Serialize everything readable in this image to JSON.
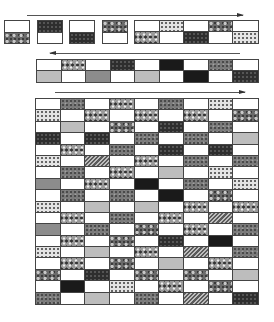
{
  "diagram": {
    "arrows": [
      {
        "id": "row1-direction",
        "direction": "right",
        "x": 27,
        "y": 15,
        "length": 216
      },
      {
        "id": "row2-direction",
        "direction": "left",
        "x": 50,
        "y": 53,
        "length": 190
      },
      {
        "id": "assembled-direction",
        "direction": "right",
        "x": 55,
        "y": 92,
        "length": 190
      }
    ],
    "loose_units": [
      {
        "top": "w",
        "bottom": "paisley"
      },
      {
        "top": "dark",
        "bottom": "w"
      },
      {
        "top": "w",
        "bottom": "dark"
      },
      {
        "top": "paisley",
        "bottom": "w"
      }
    ],
    "strip_row1": {
      "top": [
        "w",
        "dots",
        "w",
        "paisley",
        "w"
      ],
      "bottom": [
        "floral",
        "w",
        "dark",
        "w",
        "dots"
      ]
    },
    "strip_row2": {
      "top": [
        "w",
        "floral",
        "w",
        "dark",
        "w",
        "black",
        "w",
        "print",
        "w"
      ],
      "bottom": [
        "light",
        "w",
        "mid",
        "w",
        "light",
        "w",
        "black",
        "w",
        "dark"
      ]
    },
    "quilt_grid": {
      "columns": 9,
      "rows": [
        [
          "w",
          "print",
          "w",
          "floral",
          "w",
          "print",
          "w",
          "dots",
          "w"
        ],
        [
          "dots",
          "w",
          "floral",
          "w",
          "floral",
          "w",
          "floral",
          "w",
          "paisley"
        ],
        [
          "w",
          "light",
          "w",
          "paisley",
          "w",
          "dark",
          "w",
          "print",
          "w"
        ],
        [
          "dark",
          "w",
          "dark",
          "w",
          "print",
          "w",
          "print",
          "w",
          "light"
        ],
        [
          "w",
          "floral",
          "w",
          "print",
          "w",
          "dark",
          "w",
          "dark",
          "w"
        ],
        [
          "dots",
          "w",
          "stripe",
          "w",
          "floral",
          "w",
          "print",
          "w",
          "print"
        ],
        [
          "w",
          "print",
          "w",
          "floral",
          "w",
          "light",
          "w",
          "dots",
          "w"
        ],
        [
          "mid",
          "w",
          "floral",
          "w",
          "black",
          "w",
          "print",
          "w",
          "dots"
        ],
        [
          "w",
          "print",
          "w",
          "print",
          "w",
          "black",
          "w",
          "paisley",
          "w"
        ],
        [
          "dots",
          "w",
          "light",
          "w",
          "light",
          "w",
          "floral",
          "w",
          "floral"
        ],
        [
          "w",
          "floral",
          "w",
          "print",
          "w",
          "floral",
          "w",
          "stripe",
          "w"
        ],
        [
          "mid",
          "w",
          "print",
          "w",
          "paisley",
          "w",
          "floral",
          "w",
          "print"
        ],
        [
          "w",
          "floral",
          "w",
          "paisley",
          "w",
          "dark",
          "w",
          "black",
          "w"
        ],
        [
          "dots",
          "w",
          "light",
          "w",
          "floral",
          "w",
          "stripe",
          "w",
          "print"
        ],
        [
          "w",
          "floral",
          "w",
          "paisley",
          "w",
          "light",
          "w",
          "floral",
          "w"
        ],
        [
          "paisley",
          "w",
          "dark",
          "w",
          "paisley",
          "w",
          "paisley",
          "w",
          "light"
        ],
        [
          "w",
          "black",
          "w",
          "dots",
          "w",
          "floral",
          "w",
          "paisley",
          "w"
        ],
        [
          "print",
          "w",
          "light",
          "w",
          "print",
          "w",
          "stripe",
          "w",
          "dark"
        ]
      ]
    }
  }
}
